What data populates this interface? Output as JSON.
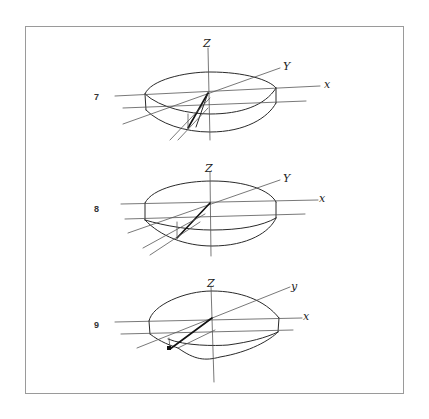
{
  "figures": [
    {
      "label": "7",
      "axis_labels": {
        "z": "Z",
        "y": "Y",
        "x": "x"
      }
    },
    {
      "label": "8",
      "axis_labels": {
        "z": "Z",
        "y": "Y",
        "x": "x"
      }
    },
    {
      "label": "9",
      "axis_labels": {
        "z": "Z",
        "y": "y",
        "x": "x"
      }
    }
  ],
  "colors": {
    "ink": "#2a2a2a",
    "frame": "#9a9a9a",
    "background": "#ffffff"
  }
}
